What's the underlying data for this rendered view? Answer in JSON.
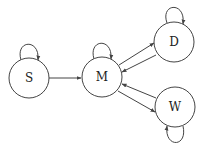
{
  "diagram": {
    "type": "state-transition-graph",
    "stroke_color": "#444444",
    "nodes": [
      {
        "id": "S",
        "label": "S",
        "cx": 29,
        "cy": 78,
        "r": 20
      },
      {
        "id": "M",
        "label": "M",
        "cx": 102,
        "cy": 77,
        "r": 20
      },
      {
        "id": "D",
        "label": "D",
        "cx": 174,
        "cy": 42,
        "r": 20
      },
      {
        "id": "W",
        "label": "W",
        "cx": 175,
        "cy": 107,
        "r": 20
      }
    ],
    "edges": [
      {
        "from": "S",
        "to": "S",
        "kind": "self-loop"
      },
      {
        "from": "M",
        "to": "M",
        "kind": "self-loop"
      },
      {
        "from": "D",
        "to": "D",
        "kind": "self-loop"
      },
      {
        "from": "W",
        "to": "W",
        "kind": "self-loop"
      },
      {
        "from": "S",
        "to": "M"
      },
      {
        "from": "M",
        "to": "D"
      },
      {
        "from": "D",
        "to": "M"
      },
      {
        "from": "M",
        "to": "W"
      },
      {
        "from": "W",
        "to": "M"
      }
    ]
  }
}
